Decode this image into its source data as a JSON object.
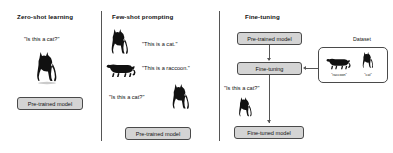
{
  "figure": {
    "caption_style": "three-panel comparison diagram",
    "background_color": "#ffffff",
    "line_color": "#555555",
    "box_fill": "#d4d4d4"
  },
  "panels": [
    {
      "id": "zero-shot",
      "title": "Zero-shot learning",
      "query": "\"Is this a cat?\"",
      "model_box": "Pre-trained model",
      "silhouettes": [
        "cat-sitting"
      ]
    },
    {
      "id": "few-shot",
      "title": "Few-shot prompting",
      "examples": [
        {
          "label": "\"This is a cat.\"",
          "silhouette": "cat-sitting"
        },
        {
          "label": "\"This is a raccoon.\"",
          "silhouette": "raccoon"
        }
      ],
      "query": "\"Is this a cat?\"",
      "query_silhouette": "cat-sitting",
      "model_box": "Pre-trained model"
    },
    {
      "id": "fine-tuning",
      "title": "Fine-tuning",
      "boxes": {
        "pretrained": "Pre-trained model",
        "finetuning": "Fine-tuning",
        "finetuned": "Fine-tuned model"
      },
      "dataset": {
        "caption": "Dataset",
        "items": [
          {
            "label": "\"raccoon\"",
            "silhouette": "raccoon"
          },
          {
            "label": "\"cat\"",
            "silhouette": "cat-sitting"
          }
        ]
      },
      "query": "\"Is this a cat?\"",
      "query_silhouette": "cat-sitting"
    }
  ]
}
